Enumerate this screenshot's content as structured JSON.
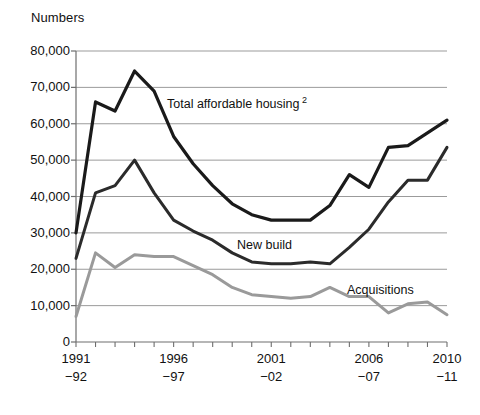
{
  "chart_data": {
    "type": "line",
    "title": "",
    "ylabel": "Numbers",
    "xlabel": "",
    "ylim": [
      0,
      80000
    ],
    "ytick_values": [
      0,
      10000,
      20000,
      30000,
      40000,
      50000,
      60000,
      70000,
      80000
    ],
    "ytick_labels": [
      "0",
      "10,000",
      "20,000",
      "30,000",
      "40,000",
      "50,000",
      "60,000",
      "70,000",
      "80,000"
    ],
    "grid": true,
    "legend_position": "inline-annotations",
    "categories": [
      "1991-92",
      "1992-93",
      "1993-94",
      "1994-95",
      "1995-96",
      "1996-97",
      "1997-98",
      "1998-99",
      "1999-00",
      "2000-01",
      "2001-02",
      "2002-03",
      "2003-04",
      "2004-05",
      "2005-06",
      "2006-07",
      "2007-08",
      "2008-09",
      "2009-10",
      "2010-11"
    ],
    "xtick_labels": [
      {
        "line1": "1991",
        "line2": "−92",
        "index": 0
      },
      {
        "line1": "1996",
        "line2": "−97",
        "index": 5
      },
      {
        "line1": "2001",
        "line2": "−02",
        "index": 10
      },
      {
        "line1": "2006",
        "line2": "−07",
        "index": 15
      },
      {
        "line1": "2010",
        "line2": "−11",
        "index": 19
      }
    ],
    "series": [
      {
        "name": "Total affordable housing ²",
        "label": "Total affordable housing",
        "label_superscript": "2",
        "color": "#1a1a1a",
        "width": 3.2,
        "values": [
          30000,
          66000,
          63500,
          74500,
          69000,
          56500,
          49000,
          43000,
          38000,
          35000,
          33500,
          33500,
          33500,
          37500,
          46000,
          42500,
          53500,
          54000,
          57500,
          61000
        ]
      },
      {
        "name": "New build",
        "label": "New build",
        "color": "#2b2b2b",
        "width": 3.0,
        "values": [
          23000,
          41000,
          43000,
          50000,
          41000,
          33500,
          30500,
          28000,
          24500,
          22000,
          21500,
          21500,
          22000,
          21500,
          26000,
          31000,
          38500,
          44500,
          44500,
          53500
        ]
      },
      {
        "name": "Acquisitions",
        "label": "Acquisitions",
        "color": "#9a9a9a",
        "width": 3.0,
        "values": [
          7000,
          24500,
          20500,
          24000,
          23500,
          23500,
          21000,
          18500,
          15000,
          13000,
          12500,
          12000,
          12500,
          15000,
          12500,
          12500,
          8000,
          10500,
          11000,
          7500
        ]
      }
    ],
    "annotations": [
      {
        "text": "Total affordable housing",
        "superscript": "2",
        "x": 167,
        "y": 95
      },
      {
        "text": "New build",
        "superscript": "",
        "x": 237,
        "y": 238
      },
      {
        "text": "Acquisitions",
        "superscript": "",
        "x": 347,
        "y": 283
      }
    ],
    "colors": {
      "total": "#1a1a1a",
      "new_build": "#2b2b2b",
      "acquisitions": "#9a9a9a",
      "grid": "#9b9b9b",
      "axis": "#6e6e6e",
      "background": "#ffffff"
    }
  }
}
